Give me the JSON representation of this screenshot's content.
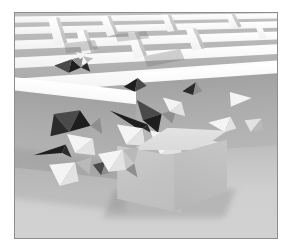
{
  "figure": {
    "description": "Grayscale 3D render: an overhead perspective maze of white walls on a light plate, with a large gray cube smashing through the near wall and scattering triangular shards.",
    "medium": "3d-render",
    "palette": "grayscale",
    "frame": {
      "border_color": "#8d8d8d",
      "page_background": "#ffffff",
      "margin_px": 13
    },
    "colors": {
      "sky": "#f7f7f7",
      "maze_top_lit": "#ffffff",
      "maze_path_shadow": "#b4b4b4",
      "wall_front_face": "#ababab",
      "floor_near": "#d2d2d2",
      "floor_far": "#b6b6b6",
      "cube_top": "#e0e0e0",
      "cube_left": "#c6c6c6",
      "cube_right": "#bdbdbd",
      "shard_lit": "#f4f4f4",
      "shard_shadow": "#2b2b2b"
    },
    "scene": {
      "camera": "elevated three-quarter view",
      "light": "high key, single directional source from upper left",
      "objects": [
        {
          "name": "maze",
          "role": "background-structure"
        },
        {
          "name": "broken-wall",
          "role": "impact-site"
        },
        {
          "name": "cube",
          "role": "subject"
        },
        {
          "name": "debris-shards",
          "role": "particles",
          "count": 24
        },
        {
          "name": "ground-plane",
          "role": "floor"
        }
      ]
    }
  },
  "maze": {
    "wall_color": "#ffffff",
    "path_color": "#b4b4b4",
    "rows": 7,
    "cols": 11,
    "segments": [
      {
        "id": "h1",
        "x": 0,
        "y": 10,
        "w": 460,
        "h": 9
      },
      {
        "id": "h2",
        "x": 0,
        "y": 30,
        "w": 300,
        "h": 9
      },
      {
        "id": "h3",
        "x": 140,
        "y": 30,
        "w": 320,
        "h": 9
      },
      {
        "id": "h4",
        "x": 0,
        "y": 52,
        "w": 200,
        "h": 10
      },
      {
        "id": "h5",
        "x": 250,
        "y": 52,
        "w": 210,
        "h": 10
      },
      {
        "id": "h6",
        "x": 0,
        "y": 76,
        "w": 460,
        "h": 11
      },
      {
        "id": "v1",
        "x": 60,
        "y": 10,
        "w": 9,
        "h": 44
      },
      {
        "id": "v2",
        "x": 150,
        "y": 30,
        "w": 9,
        "h": 48
      },
      {
        "id": "v3",
        "x": 240,
        "y": 10,
        "w": 9,
        "h": 46
      },
      {
        "id": "v4",
        "x": 330,
        "y": 30,
        "w": 9,
        "h": 50
      },
      {
        "id": "v5",
        "x": 405,
        "y": 10,
        "w": 9,
        "h": 44
      }
    ]
  },
  "debris": {
    "label": "triangular-shards",
    "clusters": [
      {
        "id": "upper-left-break",
        "shards": 5,
        "tone": "dark"
      },
      {
        "id": "left-burst",
        "shards": 8,
        "tone": "mixed"
      },
      {
        "id": "center-burst",
        "shards": 7,
        "tone": "mixed"
      },
      {
        "id": "right-scatter",
        "shards": 4,
        "tone": "light"
      }
    ]
  }
}
